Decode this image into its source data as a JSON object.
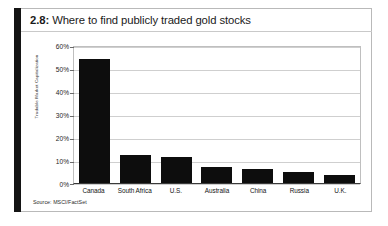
{
  "figure": {
    "number_label": "2.8:",
    "title": "Where to find publicly traded gold stocks",
    "source_note": "Source: MSCI/FactSet",
    "accent_color": "#141414",
    "bar_color": "#0d0d0d",
    "grid_color": "#cfcfcf",
    "frame_color": "#bfbfbf"
  },
  "chart_data": {
    "type": "bar",
    "title": "Where to find publicly traded gold stocks",
    "xlabel": "",
    "ylabel": "Tradable Market Capitalization",
    "ylim": [
      0,
      60
    ],
    "yticks": [
      "0%",
      "10%",
      "20%",
      "30%",
      "40%",
      "50%",
      "60%"
    ],
    "ytick_values": [
      0,
      10,
      20,
      30,
      40,
      50,
      60
    ],
    "grid": true,
    "legend": "none",
    "categories": [
      "Canada",
      "South Africa",
      "U.S.",
      "Australia",
      "China",
      "Russia",
      "U.K."
    ],
    "values": [
      54,
      12,
      11.5,
      7,
      6,
      5,
      3.5
    ],
    "value_unit": "%",
    "source": "Source: MSCI/FactSet"
  }
}
